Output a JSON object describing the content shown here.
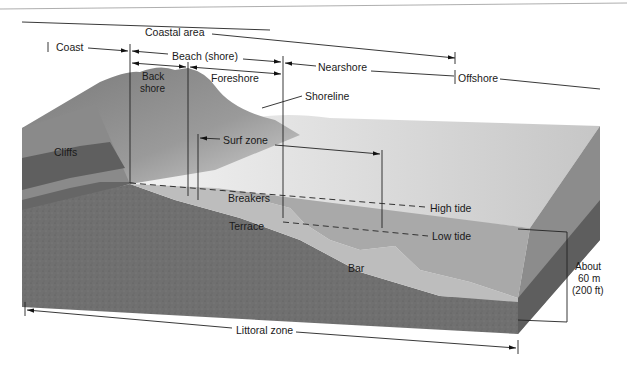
{
  "diagram": {
    "type": "coastal-zone-block-diagram",
    "labels": {
      "coastal_area": "Coastal area",
      "coast": "Coast",
      "beach_shore": "Beach (shore)",
      "back_shore_line1": "Back",
      "back_shore_line2": "shore",
      "foreshore": "Foreshore",
      "nearshore": "Nearshore",
      "offshore": "Offshore",
      "shoreline": "Shoreline",
      "surf_zone": "Surf zone",
      "cliffs": "Cliffs",
      "breakers": "Breakers",
      "high_tide": "High tide",
      "low_tide": "Low tide",
      "terrace": "Terrace",
      "bar": "Bar",
      "depth_line1": "About",
      "depth_line2": "60 m",
      "depth_line3": "(200 ft)",
      "littoral_zone": "Littoral zone"
    },
    "colors": {
      "background": "#ffffff",
      "land_dark": "#6e6e6e",
      "land_mid": "#8c8c8c",
      "cliff_band_dark": "#5a5a5a",
      "sand": "#b9b9b9",
      "water_surface": "#d8d8d8",
      "water_side": "#a8a8a8",
      "block_side_dark": "#6a6a6a",
      "line": "#222222"
    }
  }
}
